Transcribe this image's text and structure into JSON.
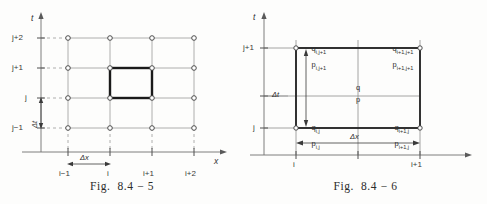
{
  "page": {
    "background": "#fdfdfc",
    "ink": "#2b2b2b",
    "grid_color": "#9a9a9a",
    "bold_color": "#1a1a1a"
  },
  "figures": [
    {
      "id": "fig-8-4-5",
      "caption": "Fig.  8.4 − 5",
      "axis": {
        "x_label": "x",
        "t_label": "t"
      },
      "x_ticks": [
        "i−1",
        "i",
        "i+1",
        "i+2"
      ],
      "y_ticks": [
        "j+2",
        "j+1",
        "j",
        "j−1"
      ],
      "dimensions": {
        "dx": "Δx",
        "dt": "Δt"
      },
      "grid": {
        "columns": 4,
        "rows": 4,
        "node_marker": "circle"
      },
      "highlight_cell": {
        "from_x": "i",
        "to_x": "i+1",
        "from_y": "j",
        "to_y": "j+1"
      }
    },
    {
      "id": "fig-8-4-6",
      "caption": "Fig.  8.4 − 6",
      "axis": {
        "x_label": "",
        "t_label": "t"
      },
      "x_ticks": [
        "i",
        "i+1"
      ],
      "y_ticks": [
        "j+1",
        "j"
      ],
      "dimensions": {
        "dx": "Δx",
        "dt": "Δt"
      },
      "corner_labels": {
        "top_left_q": "q",
        "top_left_q_sub": "i,j+1",
        "top_left_p": "p",
        "top_left_p_sub": "i,j+1",
        "top_right_q": "q",
        "top_right_q_sub": "i+1,j+1",
        "top_right_p": "p",
        "top_right_p_sub": "i+1,j+1",
        "bottom_left_q": "q",
        "bottom_left_q_sub": "i,j",
        "bottom_left_p": "p",
        "bottom_left_p_sub": "i,j",
        "bottom_right_q": "q",
        "bottom_right_q_sub": "i+1,j",
        "bottom_right_p": "p",
        "bottom_right_p_sub": "i+1,j"
      },
      "center_labels": {
        "q": "q",
        "p": "p"
      }
    }
  ]
}
